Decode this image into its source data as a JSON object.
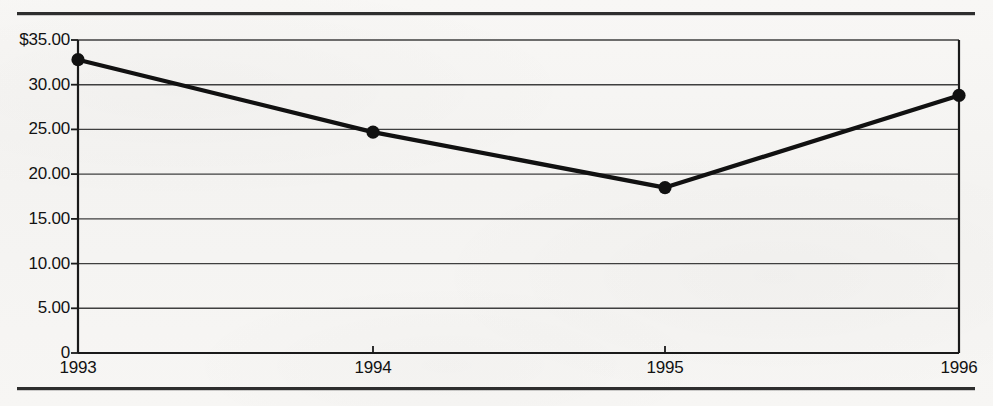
{
  "chart_data": {
    "type": "line",
    "title": "",
    "subtitle": "",
    "xlabel": "",
    "ylabel": "",
    "categories": [
      "1993",
      "1994",
      "1995",
      "1996"
    ],
    "values": [
      32.8,
      24.7,
      18.5,
      28.8
    ],
    "series": [
      {
        "name": "",
        "values": [
          32.8,
          24.7,
          18.5,
          28.8
        ]
      }
    ],
    "ylim": [
      0,
      35
    ],
    "ytick_values": [
      35,
      30,
      25,
      20,
      15,
      10,
      5,
      0
    ],
    "ytick_labels": [
      "$35.00",
      "30.00",
      "25.00",
      "20.00",
      "15.00",
      "10.00",
      "5.00",
      "0"
    ],
    "xtick_labels": [
      "1993",
      "1994",
      "1995",
      "1996"
    ],
    "grid": "horizontal",
    "legend": "none",
    "markers": "filled-circle",
    "annotations": []
  },
  "style": {
    "line_color": "#111111",
    "marker_color": "#111111",
    "grid_color": "#4a4a4a",
    "axis_color": "#1a1a1a",
    "text_color": "#121212",
    "background": "#f6f5f3",
    "rule_color": "#2e2e2e"
  },
  "rules": {
    "top": "horizontal-rule",
    "bottom": "horizontal-rule"
  }
}
